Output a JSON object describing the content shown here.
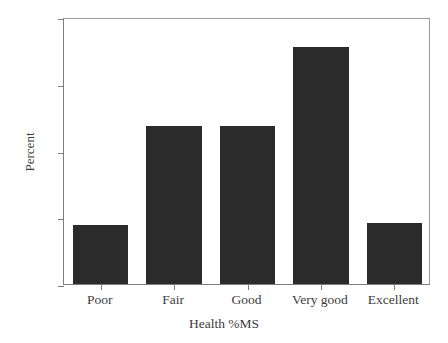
{
  "chart_data": {
    "type": "bar",
    "title": "",
    "subtitle": "",
    "xlabel": "Health %MS",
    "ylabel": "Percent",
    "categories": [
      "Poor",
      "Fair",
      "Good",
      "Very good",
      "Excellent"
    ],
    "values": [
      8.9,
      23.6,
      23.7,
      35.5,
      9.2
    ],
    "ylim": [
      0,
      40
    ],
    "yticks": [
      0,
      10,
      20,
      30,
      40
    ],
    "ytick_labels": [
      "0",
      "10",
      "20",
      "30",
      "40"
    ],
    "grid": false,
    "legend": false,
    "legend_position": "none",
    "bar_color": "#2b2b2b",
    "axis_color": "#7d7d7d",
    "background_color": "#ffffff",
    "text_color": "#3d3d3d"
  }
}
